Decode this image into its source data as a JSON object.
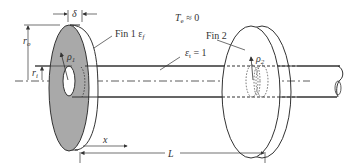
{
  "diagram": {
    "labels": {
      "thickness": "δ",
      "outer_radius": "r",
      "outer_radius_sub": "o",
      "inner_radius": "r",
      "inner_radius_sub": "i",
      "fin1": "Fin 1 ε",
      "fin1_sub": "f",
      "fin2": "Fin 2",
      "rho1": "ρ",
      "rho1_sub": "1",
      "rho2": "ρ",
      "rho2_sub": "2",
      "env_temp": "T",
      "env_temp_sub": "e",
      "env_temp_val": " ≈ 0",
      "rod_emissivity": "ε",
      "rod_emissivity_sub": "t",
      "rod_emissivity_val": " = 1",
      "x": "x",
      "L": "L"
    },
    "colors": {
      "fin1_face": "#a9a9a9",
      "line": "#333333",
      "background": "#ffffff"
    }
  }
}
